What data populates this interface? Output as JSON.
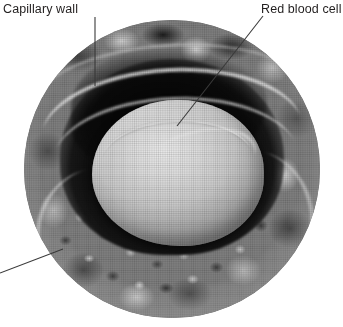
{
  "figure": {
    "background_color": "#ffffff",
    "width": 343,
    "height": 327
  },
  "labels": [
    {
      "id": "capillary-wall",
      "text": "Capillary wall",
      "color": "#221f1f"
    },
    {
      "id": "red-blood-cell",
      "text": "Red blood cell",
      "color": "#221f1f"
    }
  ],
  "leaders": [
    {
      "id": "leader-capillary-wall",
      "points": "95,17 95,86",
      "color": "#3a3a3a"
    },
    {
      "id": "leader-red-blood-cell",
      "points": "263,16 177,126",
      "color": "#3a3a3a"
    },
    {
      "id": "leader-unlabeled-lower-left",
      "points": "0,273 63,249",
      "color": "#3a3a3a"
    }
  ],
  "micrograph": {
    "name": "capillary-cross-section",
    "shape": "circle",
    "center": {
      "x": 172,
      "y": 169
    },
    "radius": 148,
    "structures": [
      {
        "name": "capillary-wall-tissue",
        "tone": "mottled-grey"
      },
      {
        "name": "capillary-lumen",
        "tone": "near-black"
      },
      {
        "name": "red-blood-cell",
        "tone": "pale-grey-disc"
      }
    ],
    "palette": {
      "wall_mid": "#7e7e7e",
      "wall_light": "#d6d6d6",
      "wall_dark": "#2a2a2a",
      "lumen": "#050505",
      "cell_highlight": "#e8e8e8",
      "cell_shadow": "#8a8a8a"
    }
  }
}
